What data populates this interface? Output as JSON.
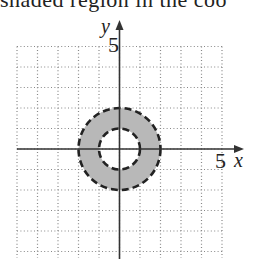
{
  "caption": {
    "text": "shaded region in the coo"
  },
  "chart_data": {
    "type": "diagram",
    "title": "",
    "xlabel": "x",
    "ylabel": "y",
    "xlim": [
      -5,
      5
    ],
    "ylim": [
      -5,
      5
    ],
    "grid": true,
    "grid_style": "dotted",
    "tick_labels": {
      "x": "5",
      "y": "5"
    },
    "region": {
      "shape": "annulus",
      "center": [
        0,
        0
      ],
      "inner_radius": 1,
      "outer_radius": 2,
      "inner_boundary": "dashed",
      "outer_boundary": "dashed",
      "fill": "#b8b8b8"
    },
    "inequality": "1 < x^2 + y^2 < 4"
  },
  "colors": {
    "fill": "#b8b8b8",
    "axis": "#333333",
    "grid": "#888888",
    "boundary": "#222222"
  }
}
